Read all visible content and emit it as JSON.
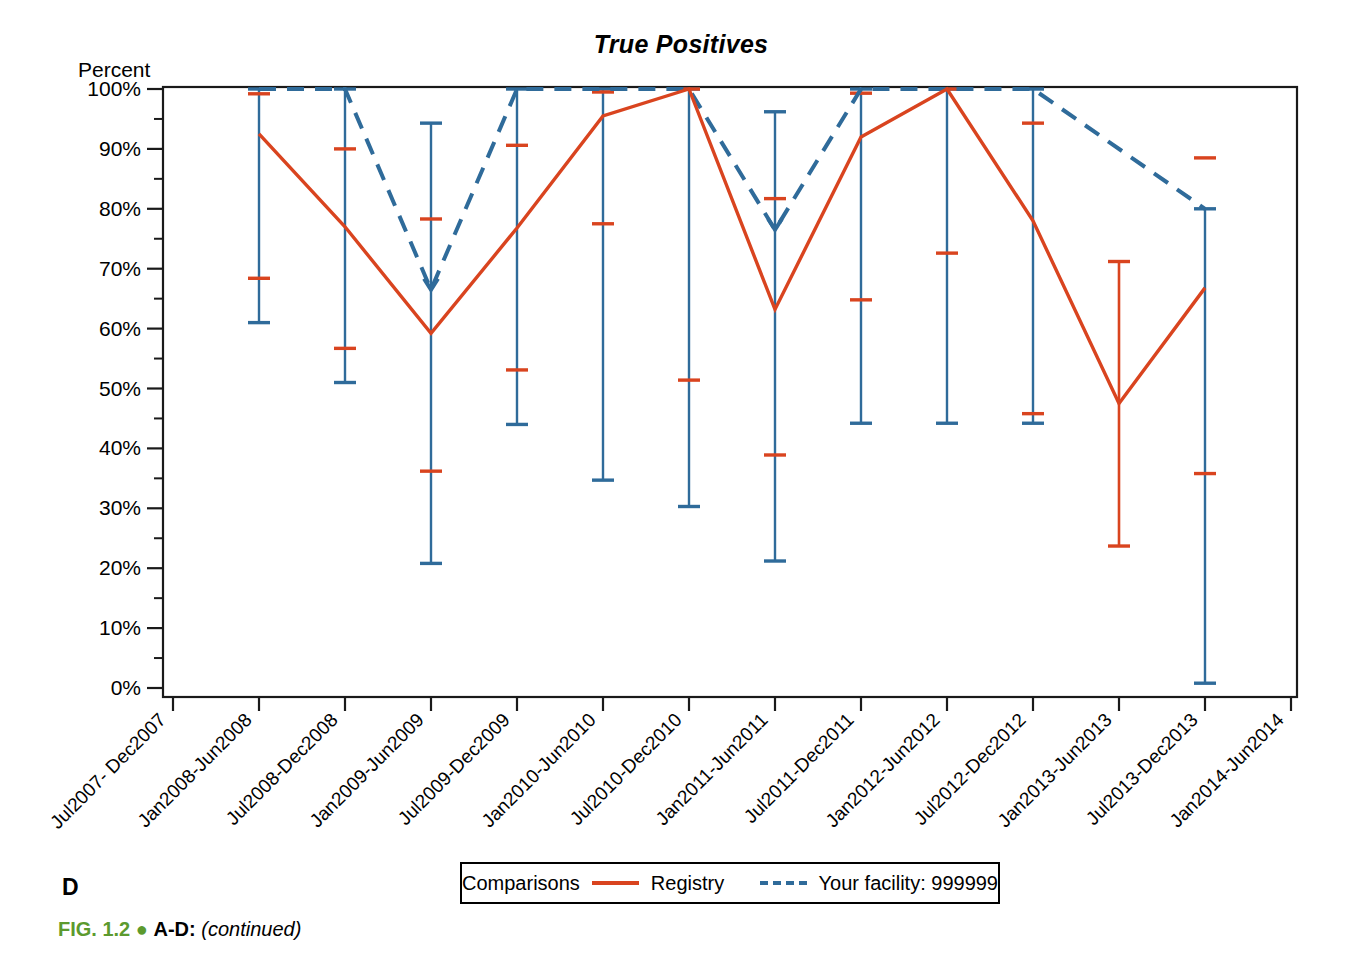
{
  "figure": {
    "panel_letter": "D",
    "caption_fignum": "FIG. 1.2",
    "caption_bullet": "●",
    "caption_panels": "A-D:",
    "caption_continued": "(continued)"
  },
  "legend": {
    "group_label": "Comparisons",
    "series1_label": "Registry",
    "series2_label": "Your facility: 999999",
    "series1_color": "#D9441F",
    "series2_color": "#2F6B9A",
    "series1_style": "solid",
    "series2_style": "dashed",
    "position": "bottom-center"
  },
  "chart_data": {
    "type": "line",
    "title": "True Positives",
    "subtitle": "",
    "xlabel": "",
    "ylabel": "Percent",
    "ylim": [
      0,
      100
    ],
    "y_major_step": 10,
    "y_minor_step": 5,
    "grid": false,
    "y_tick_labels": [
      "0%",
      "10%",
      "20%",
      "30%",
      "40%",
      "50%",
      "60%",
      "70%",
      "80%",
      "90%",
      "100%"
    ],
    "y_tick_values": [
      0,
      10,
      20,
      30,
      40,
      50,
      60,
      70,
      80,
      90,
      100
    ],
    "categories": [
      "Jul2007- Dec2007",
      "Jan2008-Jun2008",
      "Jul2008-Dec2008",
      "Jan2009-Jun2009",
      "Jul2009-Dec2009",
      "Jan2010-Jun2010",
      "Jul2010-Dec2010",
      "Jan2011-Jun2011",
      "Jul2011-Dec2011",
      "Jan2012-Jun2012",
      "Jul2012-Dec2012",
      "Jan2013-Jun2013",
      "Jul2013-Dec2013",
      "Jan2014-Jun2014"
    ],
    "xtick_rotation_deg": 45,
    "series": [
      {
        "name": "Registry",
        "color": "#D9441F",
        "style": "solid",
        "values": [
          null,
          92.5,
          77.0,
          59.2,
          76.8,
          95.5,
          100.0,
          63.2,
          92.0,
          100.0,
          78.0,
          47.5,
          66.8,
          null
        ],
        "ci_upper": [
          null,
          99.2,
          90.0,
          78.3,
          90.6,
          99.5,
          100.0,
          81.7,
          99.3,
          100.0,
          94.3,
          71.2,
          88.5,
          null
        ],
        "ci_lower": [
          null,
          68.4,
          56.7,
          36.2,
          53.1,
          77.5,
          51.4,
          38.9,
          64.8,
          72.6,
          45.8,
          23.7,
          35.8,
          null
        ]
      },
      {
        "name": "Your facility: 999999",
        "color": "#2F6B9A",
        "style": "dashed",
        "values": [
          null,
          100.0,
          100.0,
          66.5,
          100.0,
          100.0,
          100.0,
          76.5,
          100.0,
          100.0,
          100.0,
          null,
          80.0,
          null
        ],
        "ci_upper": [
          null,
          100.0,
          100.0,
          94.3,
          100.0,
          100.0,
          100.0,
          96.2,
          100.0,
          100.0,
          100.0,
          null,
          80.0,
          null
        ],
        "ci_lower": [
          null,
          61.0,
          51.0,
          20.8,
          44.0,
          34.7,
          30.3,
          21.2,
          44.2,
          44.2,
          44.2,
          null,
          0.8,
          null
        ]
      }
    ]
  }
}
